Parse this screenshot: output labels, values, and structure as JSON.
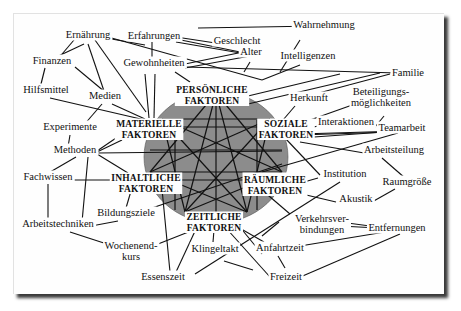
{
  "figure": {
    "type": "concept-network",
    "circle": {
      "cx": 216,
      "cy": 157,
      "rx": 72,
      "ry": 66,
      "fill": "#8c8c8c"
    },
    "factors": [
      {
        "id": "pers",
        "lines": [
          "PERSÖNLICHE",
          "FAKTOREN"
        ],
        "x": 212,
        "y": 93
      },
      {
        "id": "soz",
        "lines": [
          "SOZIALE",
          "FAKTOREN"
        ],
        "x": 286,
        "y": 127
      },
      {
        "id": "raeum",
        "lines": [
          "RÄUMLICHE",
          "FAKTOREN"
        ],
        "x": 275,
        "y": 183
      },
      {
        "id": "zeit",
        "lines": [
          "ZEITLICHE",
          "FAKTOREN"
        ],
        "x": 214,
        "y": 220
      },
      {
        "id": "inh",
        "lines": [
          "INHALTLICHE",
          "FAKTOREN"
        ],
        "x": 146,
        "y": 181
      },
      {
        "id": "mat",
        "lines": [
          "MATERIELLE",
          "FAKTOREN"
        ],
        "x": 149,
        "y": 127
      }
    ],
    "labels": [
      {
        "id": "ernaehrung",
        "lines": [
          "Ernährung"
        ],
        "x": 88,
        "y": 38
      },
      {
        "id": "erfahrungen",
        "lines": [
          "Erfahrungen"
        ],
        "x": 154,
        "y": 39
      },
      {
        "id": "geschlecht",
        "lines": [
          "Geschlecht"
        ],
        "x": 237,
        "y": 44
      },
      {
        "id": "alter",
        "lines": [
          "Alter"
        ],
        "x": 251,
        "y": 55
      },
      {
        "id": "wahrnehmung",
        "lines": [
          "Wahrnehmung"
        ],
        "x": 324,
        "y": 28
      },
      {
        "id": "intelligenzen",
        "lines": [
          "Intelligenzen"
        ],
        "x": 308,
        "y": 59
      },
      {
        "id": "finanzen",
        "lines": [
          "Finanzen"
        ],
        "x": 52,
        "y": 64
      },
      {
        "id": "gewohnheiten",
        "lines": [
          "Gewohnheiten"
        ],
        "x": 154,
        "y": 66
      },
      {
        "id": "familie",
        "lines": [
          "Familie"
        ],
        "x": 408,
        "y": 76
      },
      {
        "id": "hilfsmittel",
        "lines": [
          "Hilfsmittel"
        ],
        "x": 46,
        "y": 93
      },
      {
        "id": "medien",
        "lines": [
          "Medien"
        ],
        "x": 105,
        "y": 99
      },
      {
        "id": "herkunft",
        "lines": [
          "Herkunft"
        ],
        "x": 309,
        "y": 101
      },
      {
        "id": "beteiligung",
        "lines": [
          "Beteiligungs-",
          "möglichkeiten"
        ],
        "x": 381,
        "y": 95
      },
      {
        "id": "interaktionen",
        "lines": [
          "Interaktionen"
        ],
        "x": 346,
        "y": 125
      },
      {
        "id": "teamarbeit",
        "lines": [
          "Teamarbeit"
        ],
        "x": 402,
        "y": 131
      },
      {
        "id": "experimente",
        "lines": [
          "Experimente"
        ],
        "x": 70,
        "y": 130
      },
      {
        "id": "methoden",
        "lines": [
          "Methoden"
        ],
        "x": 75,
        "y": 153
      },
      {
        "id": "arbeitsteilung",
        "lines": [
          "Arbeitsteilung"
        ],
        "x": 394,
        "y": 153
      },
      {
        "id": "fachwissen",
        "lines": [
          "Fachwissen"
        ],
        "x": 48,
        "y": 180
      },
      {
        "id": "institution",
        "lines": [
          "Institution"
        ],
        "x": 345,
        "y": 177
      },
      {
        "id": "raumgroesse",
        "lines": [
          "Raumgröße"
        ],
        "x": 407,
        "y": 185
      },
      {
        "id": "akustik",
        "lines": [
          "Akustik"
        ],
        "x": 356,
        "y": 202
      },
      {
        "id": "bildungsziele",
        "lines": [
          "Bildungsziele"
        ],
        "x": 126,
        "y": 216
      },
      {
        "id": "arbeitstechniken",
        "lines": [
          "Arbeitstechniken"
        ],
        "x": 58,
        "y": 227
      },
      {
        "id": "verkehr",
        "lines": [
          "Verkehrsver-",
          "bindungen"
        ],
        "x": 322,
        "y": 222
      },
      {
        "id": "entfernungen",
        "lines": [
          "Entfernungen"
        ],
        "x": 397,
        "y": 231
      },
      {
        "id": "wochenend",
        "lines": [
          "Wochenend-",
          "kurs"
        ],
        "x": 131,
        "y": 249
      },
      {
        "id": "klingeltakt",
        "lines": [
          "Klingeltakt"
        ],
        "x": 215,
        "y": 252
      },
      {
        "id": "anfahrtzeit",
        "lines": [
          "Anfahrtzeit"
        ],
        "x": 280,
        "y": 251
      },
      {
        "id": "essenszeit",
        "lines": [
          "Essenszeit"
        ],
        "x": 163,
        "y": 280
      },
      {
        "id": "freizeit",
        "lines": [
          "Freizeit"
        ],
        "x": 286,
        "y": 280
      }
    ],
    "edges": [
      [
        106,
        38,
        145,
        45
      ],
      [
        95,
        40,
        146,
        112
      ],
      [
        88,
        44,
        104,
        91
      ],
      [
        84,
        44,
        52,
        59
      ],
      [
        74,
        40,
        57,
        60
      ],
      [
        176,
        37,
        222,
        44
      ],
      [
        176,
        39,
        250,
        54
      ],
      [
        176,
        42,
        258,
        56
      ],
      [
        108,
        37,
        262,
        80
      ],
      [
        152,
        42,
        152,
        60
      ],
      [
        198,
        28,
        318,
        26
      ],
      [
        280,
        72,
        300,
        40
      ],
      [
        262,
        80,
        300,
        65
      ],
      [
        185,
        64,
        248,
        51
      ],
      [
        185,
        68,
        250,
        56
      ],
      [
        185,
        67,
        398,
        73
      ],
      [
        145,
        74,
        149,
        118
      ],
      [
        155,
        74,
        154,
        118
      ],
      [
        175,
        72,
        190,
        82
      ],
      [
        244,
        72,
        250,
        62
      ],
      [
        75,
        67,
        105,
        92
      ],
      [
        45,
        68,
        40,
        88
      ],
      [
        50,
        98,
        145,
        120
      ],
      [
        112,
        104,
        145,
        119
      ],
      [
        102,
        104,
        83,
        126
      ],
      [
        70,
        135,
        68,
        147
      ],
      [
        97,
        151,
        119,
        136
      ],
      [
        97,
        152,
        122,
        140
      ],
      [
        97,
        153,
        282,
        151
      ],
      [
        97,
        154,
        128,
        173
      ],
      [
        76,
        157,
        45,
        175
      ],
      [
        88,
        157,
        82,
        222
      ],
      [
        70,
        180,
        120,
        180
      ],
      [
        48,
        184,
        48,
        222
      ],
      [
        86,
        227,
        118,
        221
      ],
      [
        70,
        232,
        110,
        245
      ],
      [
        131,
        191,
        126,
        208
      ],
      [
        143,
        211,
        282,
        164
      ],
      [
        162,
        189,
        170,
        272
      ],
      [
        153,
        246,
        196,
        229
      ],
      [
        196,
        229,
        176,
        272
      ],
      [
        214,
        230,
        213,
        242
      ],
      [
        248,
        96,
        340,
        74
      ],
      [
        248,
        104,
        380,
        73
      ],
      [
        283,
        120,
        295,
        106
      ],
      [
        300,
        98,
        390,
        74
      ],
      [
        296,
        125,
        355,
        104
      ],
      [
        301,
        130,
        318,
        126
      ],
      [
        375,
        127,
        384,
        116
      ],
      [
        300,
        134,
        400,
        131
      ],
      [
        300,
        138,
        398,
        131
      ],
      [
        300,
        142,
        370,
        154
      ],
      [
        300,
        135,
        392,
        132
      ],
      [
        262,
        172,
        398,
        133
      ],
      [
        285,
        138,
        320,
        175
      ],
      [
        304,
        182,
        318,
        178
      ],
      [
        285,
        190,
        336,
        202
      ],
      [
        382,
        158,
        405,
        178
      ],
      [
        372,
        202,
        395,
        189
      ],
      [
        262,
        190,
        290,
        214
      ],
      [
        340,
        222,
        400,
        230
      ],
      [
        340,
        226,
        397,
        229
      ],
      [
        279,
        222,
        262,
        236
      ],
      [
        300,
        246,
        385,
        232
      ],
      [
        278,
        256,
        285,
        268
      ],
      [
        298,
        278,
        400,
        234
      ],
      [
        236,
        226,
        264,
        242
      ],
      [
        226,
        228,
        270,
        277
      ],
      [
        239,
        226,
        262,
        254
      ],
      [
        224,
        261,
        253,
        270
      ],
      [
        195,
        274,
        340,
        182
      ]
    ],
    "star": {
      "vertices": [
        [
          216,
          93
        ],
        [
          270,
          119
        ],
        [
          282,
          172
        ],
        [
          247,
          212
        ],
        [
          185,
          212
        ],
        [
          150,
          172
        ],
        [
          162,
          119
        ]
      ],
      "hlines": [
        [
          150,
          127,
          282,
          127
        ],
        [
          150,
          150,
          282,
          150
        ],
        [
          155,
          180,
          278,
          180
        ]
      ],
      "vlines": [
        [
          216,
          93,
          216,
          212
        ],
        [
          175,
          120,
          175,
          210
        ],
        [
          257,
          120,
          257,
          210
        ]
      ]
    }
  }
}
